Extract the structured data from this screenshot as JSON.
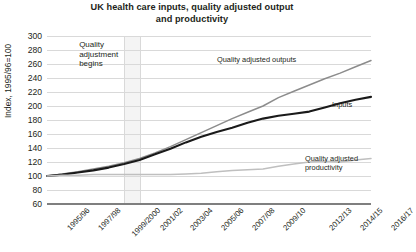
{
  "chart_data": {
    "type": "line",
    "title": "UK health care inputs, quality adjusted output\nand productivity",
    "xlabel": "",
    "ylabel": "Index, 1995/96=100",
    "ylim": [
      60,
      300
    ],
    "ytick_step": 20,
    "yticks": [
      300,
      280,
      260,
      240,
      220,
      200,
      180,
      160,
      140,
      120,
      100,
      80,
      60
    ],
    "grid": true,
    "legend_position": "inline-labels",
    "x": [
      "1995/96",
      "1996/97",
      "1997/98",
      "1998/99",
      "1999/2000",
      "2000/01",
      "2001/02",
      "2002/03",
      "2003/04",
      "2004/05",
      "2005/06",
      "2006/07",
      "2007/08",
      "2008/09",
      "2009/10",
      "2010/11",
      "2011/12",
      "2012/13",
      "2013/14",
      "2014/15",
      "2015/16",
      "2016/17"
    ],
    "xtick_labels": [
      "1995/96",
      "1997/98",
      "1999/2000",
      "2001/02",
      "2003/04",
      "2005/06",
      "2007/08",
      "2009/10",
      "2012/13",
      "2014/15",
      "2016/17"
    ],
    "series": [
      {
        "name": "Quality adjusted outputs",
        "color": "#8c8c8c",
        "values": [
          100,
          103,
          106,
          110,
          114,
          119,
          125,
          133,
          142,
          152,
          162,
          172,
          182,
          191,
          200,
          212,
          221,
          230,
          239,
          247,
          256,
          265
        ]
      },
      {
        "name": "Inputs",
        "color": "#1a1a1a",
        "values": [
          100,
          102,
          105,
          108,
          112,
          117,
          123,
          131,
          139,
          148,
          156,
          163,
          169,
          176,
          182,
          186,
          189,
          192,
          198,
          204,
          209,
          213
        ]
      },
      {
        "name": "Quality adjusted productivity",
        "color": "#bfbfbf",
        "values": [
          100,
          101,
          101,
          102,
          102,
          102,
          102,
          102,
          102,
          103,
          104,
          106,
          108,
          109,
          110,
          114,
          117,
          120,
          121,
          120,
          123,
          125
        ]
      }
    ],
    "annotations": [
      {
        "text": "Quality\nadjustment\nbegins",
        "x_value": "2000/01"
      }
    ],
    "shaded_band": {
      "from": "2000/01",
      "to": "2001/02",
      "color": "#f4f4f4"
    }
  }
}
